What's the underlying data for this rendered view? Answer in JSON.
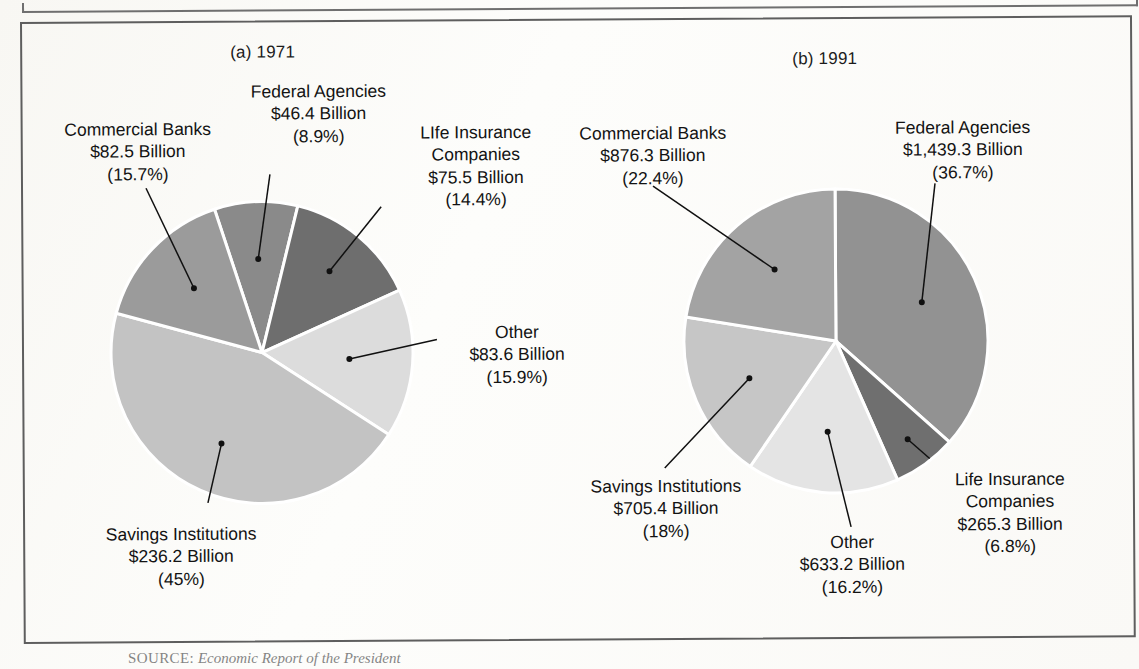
{
  "figure": {
    "source_label": "SOURCE:",
    "source_text": "Economic Report of the President"
  },
  "panels": [
    {
      "title": "(a)  1971",
      "chart_index": 0
    },
    {
      "title": "(b)  1991",
      "chart_index": 1
    }
  ],
  "colors": {
    "slice_commercial_banks_a": "#9b9b9b",
    "slice_federal_agencies_a": "#8a8a8a",
    "slice_life_insurance_a": "#6e6e6e",
    "slice_other_a": "#dcdcdc",
    "slice_savings_a": "#c3c3c3",
    "slice_commercial_banks_b": "#a3a3a3",
    "slice_federal_agencies_b": "#929292",
    "slice_life_insurance_b": "#6f6f6f",
    "slice_other_b": "#e4e4e4",
    "slice_savings_b": "#c6c6c6",
    "outline": "#5e5e5e",
    "leader": "#101010",
    "text": "#131313"
  },
  "labels_a": {
    "commercial_banks": {
      "name": "Commercial Banks",
      "amount": "$82.5 Billion",
      "percent": "(15.7%)"
    },
    "federal_agencies": {
      "name": "Federal Agencies",
      "amount": "$46.4 Billion",
      "percent": "(8.9%)"
    },
    "life_insurance": {
      "name": "LIfe Insurance",
      "name2": "Companies",
      "amount": "$75.5 Billion",
      "percent": "(14.4%)"
    },
    "other": {
      "name": "Other",
      "amount": "$83.6 Billion",
      "percent": "(15.9%)"
    },
    "savings": {
      "name": "Savings Institutions",
      "amount": "$236.2 Billion",
      "percent": "(45%)"
    }
  },
  "labels_b": {
    "commercial_banks": {
      "name": "Commercial Banks",
      "amount": "$876.3 Billion",
      "percent": "(22.4%)"
    },
    "federal_agencies": {
      "name": "Federal Agencies",
      "amount": "$1,439.3 Billion",
      "percent": "(36.7%)"
    },
    "life_insurance": {
      "name": "Life Insurance",
      "name2": "Companies",
      "amount": "$265.3 Billion",
      "percent": "(6.8%)"
    },
    "other": {
      "name": "Other",
      "amount": "$633.2 Billion",
      "percent": "(16.2%)"
    },
    "savings": {
      "name": "Savings Institutions",
      "amount": "$705.4 Billion",
      "percent": "(18%)"
    }
  },
  "chart_data": [
    {
      "type": "pie",
      "title": "(a)  1971",
      "unit": "Billions of dollars",
      "total": 524.2,
      "start_angle_deg": -108,
      "direction": "clockwise",
      "grid": false,
      "legend": "none",
      "labels_on_slices": true,
      "categories": [
        "Federal Agencies",
        "Life Insurance Companies",
        "Other",
        "Savings Institutions",
        "Commercial Banks"
      ],
      "values": [
        46.4,
        75.5,
        83.6,
        236.2,
        82.5
      ],
      "percents": [
        8.9,
        14.4,
        15.9,
        45.0,
        15.7
      ],
      "value_labels": [
        "$46.4 Billion",
        "$75.5 Billion",
        "$83.6 Billion",
        "$236.2 Billion",
        "$82.5 Billion"
      ],
      "percent_labels": [
        "(8.9%)",
        "(14.4%)",
        "(15.9%)",
        "(45%)",
        "(15.7%)"
      ],
      "slice_colors": [
        "#8a8a8a",
        "#6e6e6e",
        "#dcdcdc",
        "#c3c3c3",
        "#9b9b9b"
      ]
    },
    {
      "type": "pie",
      "title": "(b)  1991",
      "unit": "Billions of dollars",
      "total": 3919.5,
      "start_angle_deg": -90,
      "direction": "clockwise",
      "grid": false,
      "legend": "none",
      "labels_on_slices": true,
      "categories": [
        "Federal Agencies",
        "Life Insurance Companies",
        "Other",
        "Savings Institutions",
        "Commercial Banks"
      ],
      "values": [
        1439.3,
        265.3,
        633.2,
        705.4,
        876.3
      ],
      "percents": [
        36.7,
        6.8,
        16.2,
        18.0,
        22.4
      ],
      "value_labels": [
        "$1,439.3 Billion",
        "$265.3 Billion",
        "$633.2 Billion",
        "$705.4 Billion",
        "$876.3 Billion"
      ],
      "percent_labels": [
        "(36.7%)",
        "(6.8%)",
        "(16.2%)",
        "(18%)",
        "(22.4%)"
      ],
      "slice_colors": [
        "#929292",
        "#6f6f6f",
        "#e4e4e4",
        "#c6c6c6",
        "#a3a3a3"
      ]
    }
  ]
}
